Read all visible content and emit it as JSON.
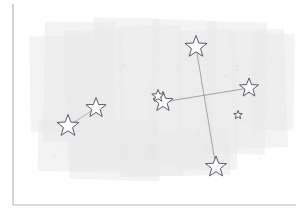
{
  "canvas": {
    "width": 301,
    "height": 215,
    "background_color": "#ffffff",
    "title": ""
  },
  "axes": {
    "name": "axis-frame",
    "color": "#b9b9b9",
    "stroke_width": 1.2,
    "vertical": {
      "x": 13,
      "y1": 4,
      "y2": 205
    },
    "horizontal": {
      "y": 205,
      "x1": 13,
      "x2": 296
    }
  },
  "brush_background": {
    "name": "brush-wash",
    "color": "#e8e8e8",
    "opacity": 0.95,
    "description": "irregular light-gray painted wash covering the central plotting area",
    "strokes": [
      {
        "x": 30,
        "y": 36,
        "w": 62,
        "h": 96,
        "rot": -1
      },
      {
        "x": 44,
        "y": 22,
        "w": 70,
        "h": 120,
        "rot": 1
      },
      {
        "x": 66,
        "y": 30,
        "w": 58,
        "h": 140,
        "rot": -2
      },
      {
        "x": 92,
        "y": 18,
        "w": 66,
        "h": 142,
        "rot": 1
      },
      {
        "x": 120,
        "y": 26,
        "w": 62,
        "h": 150,
        "rot": -1
      },
      {
        "x": 150,
        "y": 20,
        "w": 64,
        "h": 146,
        "rot": 2
      },
      {
        "x": 178,
        "y": 30,
        "w": 58,
        "h": 140,
        "rot": -1
      },
      {
        "x": 206,
        "y": 22,
        "w": 60,
        "h": 132,
        "rot": 1
      },
      {
        "x": 232,
        "y": 30,
        "w": 54,
        "h": 118,
        "rot": -2
      },
      {
        "x": 252,
        "y": 34,
        "w": 42,
        "h": 96,
        "rot": 1
      },
      {
        "x": 38,
        "y": 120,
        "w": 120,
        "h": 52,
        "rot": 1
      },
      {
        "x": 120,
        "y": 130,
        "w": 110,
        "h": 46,
        "rot": -1
      },
      {
        "x": 70,
        "y": 140,
        "w": 90,
        "h": 40,
        "rot": 2
      }
    ]
  },
  "constellations": [
    {
      "name": "cross-constellation",
      "line_color": "#8a8a8a",
      "line_width": 0.9,
      "edges": [
        {
          "from": 0,
          "to": 3
        },
        {
          "from": 1,
          "to": 2
        }
      ],
      "stars": [
        {
          "id": "star-cross-top",
          "x": 196,
          "y": 47,
          "size": 11.5,
          "label": ""
        },
        {
          "id": "star-cross-left",
          "x": 163,
          "y": 102,
          "size": 10.5,
          "label": ""
        },
        {
          "id": "star-cross-right",
          "x": 249,
          "y": 88,
          "size": 10.0,
          "label": ""
        },
        {
          "id": "star-cross-bottom",
          "x": 216,
          "y": 167,
          "size": 11.0,
          "label": ""
        }
      ]
    },
    {
      "name": "pair-constellation",
      "line_color": "#9a9a9a",
      "line_width": 0.9,
      "edges": [
        {
          "from": 0,
          "to": 1
        }
      ],
      "stars": [
        {
          "id": "star-pair-lower",
          "x": 68,
          "y": 126,
          "size": 11.5,
          "label": ""
        },
        {
          "id": "star-pair-upper",
          "x": 96,
          "y": 108,
          "size": 10.5,
          "label": ""
        }
      ]
    }
  ],
  "loose_stars": [
    {
      "id": "star-companion-left",
      "x": 158,
      "y": 96,
      "size": 6.5,
      "label": ""
    },
    {
      "id": "star-small-right",
      "x": 238,
      "y": 115,
      "size": 4.5,
      "label": ""
    }
  ],
  "style": {
    "star_fill": "#ffffff",
    "star_stroke": "#5a5a6a",
    "star_stroke_width": 1.0
  }
}
